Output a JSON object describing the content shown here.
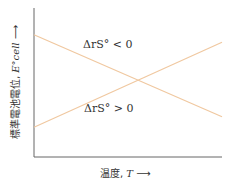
{
  "chart_data": {
    "type": "line",
    "title": "",
    "xlabel": "温度, T →",
    "ylabel": "標準電池電位, E°cell →",
    "x": [
      0,
      1
    ],
    "series": [
      {
        "name": "ΔrS° < 0",
        "values": [
          0.82,
          0.27
        ],
        "color": "#f0c8a0"
      },
      {
        "name": "ΔrS° > 0",
        "values": [
          0.2,
          0.77
        ],
        "color": "#f0c8a0"
      }
    ],
    "xlim": [
      0,
      1
    ],
    "ylim": [
      0,
      1
    ],
    "grid": false,
    "ticks": false,
    "annotations": [
      "ΔrS° < 0",
      "ΔrS° > 0"
    ]
  },
  "labels": {
    "series_neg": "ΔrS° < 0",
    "series_pos": "ΔrS° > 0",
    "xaxis_text": "温度, ",
    "xaxis_var": "T",
    "xaxis_arrow": " ⟶",
    "yaxis_text": "標準電池電位, ",
    "yaxis_var": "E°cell",
    "yaxis_arrow": " ⟶"
  }
}
